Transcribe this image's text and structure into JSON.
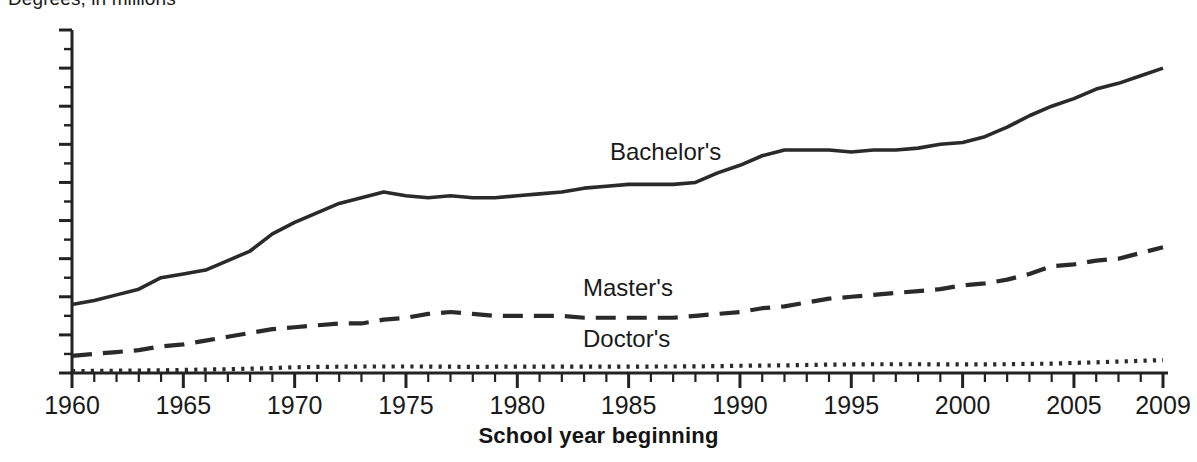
{
  "chart_title": "Degrees, in millions",
  "axis": {
    "x_title": "School year beginning",
    "y_ticks": [
      "1.8",
      "1.6",
      "1.4",
      "1.2",
      "1.0",
      "0.8",
      "0.6",
      "0.4",
      "0.2",
      "0"
    ],
    "x_ticks": [
      "1960",
      "1965",
      "1970",
      "1975",
      "1980",
      "1985",
      "1990",
      "1995",
      "2000",
      "2005",
      "2009"
    ]
  },
  "labels": {
    "bachelors": "Bachelor's",
    "masters": "Master's",
    "doctors": "Doctor's"
  },
  "colors": {
    "line": "#2a2a2a",
    "axis": "#222222",
    "background": "#ffffff"
  },
  "chart_data": {
    "type": "line",
    "title": "Degrees, in millions",
    "xlabel": "School year beginning",
    "ylabel": "",
    "xlim": [
      1960,
      2009
    ],
    "ylim": [
      0,
      1.8
    ],
    "grid": false,
    "legend": "inline-labels",
    "x": [
      1960,
      1961,
      1962,
      1963,
      1964,
      1965,
      1966,
      1967,
      1968,
      1969,
      1970,
      1971,
      1972,
      1973,
      1974,
      1975,
      1976,
      1977,
      1978,
      1979,
      1980,
      1981,
      1982,
      1983,
      1984,
      1985,
      1986,
      1987,
      1988,
      1989,
      1990,
      1991,
      1992,
      1993,
      1994,
      1995,
      1996,
      1997,
      1998,
      1999,
      2000,
      2001,
      2002,
      2003,
      2004,
      2005,
      2006,
      2007,
      2008,
      2009
    ],
    "series": [
      {
        "name": "Bachelor's",
        "style": "solid",
        "values": [
          0.36,
          0.38,
          0.41,
          0.44,
          0.5,
          0.52,
          0.54,
          0.59,
          0.64,
          0.73,
          0.79,
          0.84,
          0.89,
          0.92,
          0.95,
          0.93,
          0.92,
          0.93,
          0.92,
          0.92,
          0.93,
          0.94,
          0.95,
          0.97,
          0.98,
          0.99,
          0.99,
          0.99,
          1.0,
          1.05,
          1.09,
          1.14,
          1.17,
          1.17,
          1.17,
          1.16,
          1.17,
          1.17,
          1.18,
          1.2,
          1.21,
          1.24,
          1.29,
          1.35,
          1.4,
          1.44,
          1.49,
          1.52,
          1.56,
          1.6
        ]
      },
      {
        "name": "Master's",
        "style": "dashed",
        "values": [
          0.09,
          0.1,
          0.11,
          0.12,
          0.14,
          0.15,
          0.17,
          0.19,
          0.21,
          0.23,
          0.24,
          0.25,
          0.26,
          0.26,
          0.28,
          0.29,
          0.31,
          0.32,
          0.31,
          0.3,
          0.3,
          0.3,
          0.3,
          0.29,
          0.29,
          0.29,
          0.29,
          0.29,
          0.3,
          0.31,
          0.32,
          0.34,
          0.35,
          0.37,
          0.39,
          0.4,
          0.41,
          0.42,
          0.43,
          0.44,
          0.46,
          0.47,
          0.49,
          0.52,
          0.56,
          0.57,
          0.59,
          0.6,
          0.63,
          0.66
        ]
      },
      {
        "name": "Doctor's",
        "style": "dotted",
        "values": [
          0.01,
          0.011,
          0.012,
          0.013,
          0.014,
          0.016,
          0.018,
          0.02,
          0.023,
          0.026,
          0.03,
          0.032,
          0.033,
          0.034,
          0.034,
          0.034,
          0.034,
          0.033,
          0.032,
          0.033,
          0.033,
          0.033,
          0.033,
          0.033,
          0.033,
          0.033,
          0.034,
          0.034,
          0.035,
          0.036,
          0.038,
          0.039,
          0.04,
          0.042,
          0.044,
          0.045,
          0.046,
          0.046,
          0.046,
          0.045,
          0.045,
          0.045,
          0.046,
          0.048,
          0.049,
          0.053,
          0.056,
          0.06,
          0.064,
          0.068
        ]
      }
    ]
  }
}
